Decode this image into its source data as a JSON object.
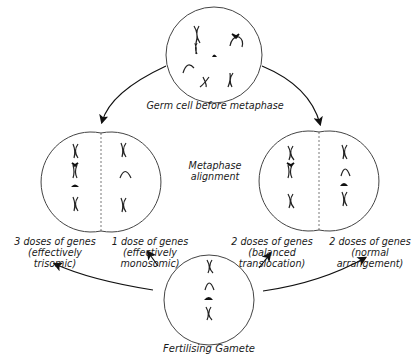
{
  "diagram": {
    "top_cell": {
      "label": "Germ cell before metaphase"
    },
    "middle_label": {
      "line1": "Metaphase",
      "line2": "alignment"
    },
    "left_division": {
      "left_half": {
        "line1": "3 doses of genes",
        "line2": "(effectively",
        "line3": "trisomic)"
      },
      "right_half": {
        "line1": "1 dose of genes",
        "line2": "(effectively",
        "line3": "monosomic)"
      }
    },
    "right_division": {
      "left_half": {
        "line1": "2 doses of genes",
        "line2": "(balanced",
        "line3": "translocation)"
      },
      "right_half": {
        "line1": "2 doses of genes",
        "line2": "(normal",
        "line3": "arrangement)"
      }
    },
    "bottom_cell": {
      "label": "Fertilising Gamete"
    },
    "colors": {
      "stroke": "#222222",
      "background": "#ffffff"
    }
  }
}
